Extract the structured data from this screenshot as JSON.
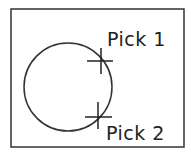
{
  "diagram": {
    "colors": {
      "stroke": "#333333",
      "text": "#222222",
      "background": "#ffffff"
    },
    "frame": {
      "x": 11,
      "y": 9,
      "width": 173,
      "height": 138
    },
    "circle": {
      "cx": 68,
      "cy": 87,
      "r": 44
    },
    "picks": [
      {
        "label": "Pick 1",
        "marker": {
          "x": 101,
          "y": 61,
          "h_from": 87,
          "h_to": 113,
          "v_from": 48,
          "v_to": 74
        },
        "label_x": 108,
        "label_y": 46
      },
      {
        "label": "Pick 2",
        "marker": {
          "x": 98,
          "y": 117,
          "h_from": 85,
          "h_to": 112,
          "v_from": 102,
          "v_to": 129
        },
        "label_x": 107,
        "label_y": 140
      }
    ]
  }
}
